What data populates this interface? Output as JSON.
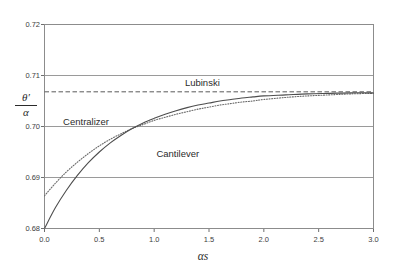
{
  "chart_data": {
    "type": "line",
    "title": "",
    "xlabel": "αs",
    "ylabel_numerator": "θ′",
    "ylabel_denominator": "α",
    "xlim": [
      0.0,
      3.0
    ],
    "ylim": [
      0.68,
      0.72
    ],
    "xticks": [
      "0.0",
      "0.5",
      "1.0",
      "1.5",
      "2.0",
      "2.5",
      "3.0"
    ],
    "xtick_values": [
      0.0,
      0.5,
      1.0,
      1.5,
      2.0,
      2.5,
      3.0
    ],
    "yticks": [
      "0.68",
      "0.69",
      "0.70",
      "0.71",
      "0.72"
    ],
    "ytick_values": [
      0.68,
      0.69,
      0.7,
      0.71,
      0.72
    ],
    "grid": "horizontal-major",
    "legend_position": "inline-annotations",
    "series": [
      {
        "name": "Cantilever",
        "style": "solid",
        "color": "#4d4d4d",
        "label_x": 1.02,
        "label_y": 0.6945,
        "x": [
          0.0,
          0.1,
          0.2,
          0.3,
          0.4,
          0.5,
          0.6,
          0.7,
          0.8,
          0.9,
          1.0,
          1.1,
          1.2,
          1.3,
          1.4,
          1.5,
          1.6,
          1.7,
          1.8,
          1.9,
          2.0,
          2.2,
          2.4,
          2.6,
          2.8,
          3.0
        ],
        "y": [
          0.68,
          0.6841,
          0.6875,
          0.6904,
          0.6929,
          0.695,
          0.6968,
          0.6983,
          0.6996,
          0.7007,
          0.7016,
          0.7024,
          0.7031,
          0.7037,
          0.7042,
          0.7046,
          0.705,
          0.7053,
          0.7056,
          0.7058,
          0.706,
          0.7062,
          0.7064,
          0.7065,
          0.7066,
          0.7066
        ]
      },
      {
        "name": "Centralizer",
        "style": "dotted",
        "color": "#6b6b6b",
        "label_x": 0.17,
        "label_y": 0.7006,
        "x": [
          0.0,
          0.1,
          0.2,
          0.3,
          0.4,
          0.5,
          0.6,
          0.7,
          0.8,
          0.9,
          1.0,
          1.1,
          1.2,
          1.3,
          1.4,
          1.5,
          1.6,
          1.7,
          1.8,
          1.9,
          2.0,
          2.2,
          2.4,
          2.6,
          2.8,
          3.0
        ],
        "y": [
          0.6864,
          0.6889,
          0.6911,
          0.693,
          0.6947,
          0.6962,
          0.6975,
          0.6986,
          0.6996,
          0.7004,
          0.7012,
          0.7018,
          0.7024,
          0.7029,
          0.7034,
          0.7038,
          0.7042,
          0.7045,
          0.7048,
          0.705,
          0.7053,
          0.7057,
          0.706,
          0.7062,
          0.7064,
          0.7065
        ]
      },
      {
        "name": "Lubinski",
        "style": "dashed",
        "color": "#5a5a5a",
        "label_x": 1.28,
        "label_y": 0.7084,
        "constant_y": 0.7068
      }
    ]
  }
}
